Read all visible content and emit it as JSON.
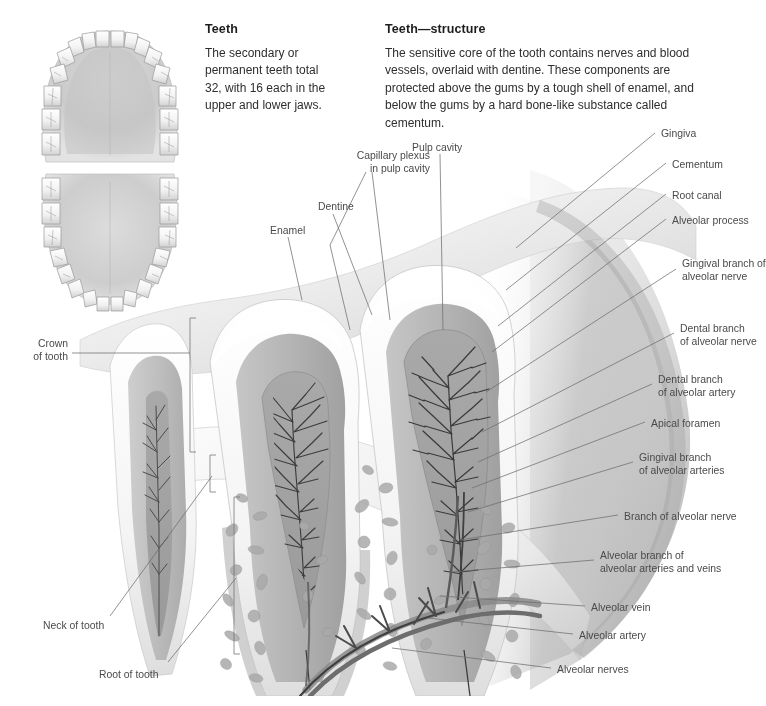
{
  "page": {
    "width": 766,
    "height": 706,
    "background": "#ffffff",
    "ink": "#4a4a4a",
    "heading_color": "#1d1d1d",
    "leader_color": "#6e6e6e"
  },
  "text_blocks": [
    {
      "id": "teeth",
      "heading": "Teeth",
      "body": "The secondary or permanent teeth total 32, with 16 each in the upper and lower jaws."
    },
    {
      "id": "structure",
      "heading": "Teeth—structure",
      "body": "The sensitive core of the tooth contains nerves and blood vessels, overlaid with dentine. These components are protected above the gums by a tough shell of enamel, and below the gums by a hard bone-like substance called cementum."
    }
  ],
  "arch_diagrams": [
    {
      "id": "upper-jaw-arch",
      "caption": "upper jaw dental arch",
      "teeth_count": 16
    },
    {
      "id": "lower-jaw-arch",
      "caption": "lower jaw dental arch",
      "teeth_count": 16
    }
  ],
  "labels_top": [
    {
      "id": "enamel",
      "text": "Enamel",
      "x": 270,
      "y": 225,
      "align": "left"
    },
    {
      "id": "dentine",
      "text": "Dentine",
      "x": 318,
      "y": 201,
      "align": "left"
    },
    {
      "id": "capillary-plexus",
      "text": "Capillary plexus\nin pulp cavity",
      "x": 335,
      "y": 150,
      "align": "left"
    },
    {
      "id": "pulp-cavity",
      "text": "Pulp cavity",
      "x": 412,
      "y": 142,
      "align": "left"
    }
  ],
  "labels_left": [
    {
      "id": "crown-of-tooth",
      "text": "Crown\nof tooth",
      "x": 20,
      "y": 338,
      "align": "left"
    },
    {
      "id": "neck-of-tooth",
      "text": "Neck of tooth",
      "x": 43,
      "y": 620,
      "align": "left"
    },
    {
      "id": "root-of-tooth",
      "text": "Root of tooth",
      "x": 99,
      "y": 669,
      "align": "left"
    }
  ],
  "labels_right": [
    {
      "id": "gingiva",
      "text": "Gingiva",
      "x": 661,
      "y": 128
    },
    {
      "id": "cementum",
      "text": "Cementum",
      "x": 672,
      "y": 159
    },
    {
      "id": "root-canal",
      "text": "Root canal",
      "x": 672,
      "y": 190
    },
    {
      "id": "alveolar-process",
      "text": "Alveolar process",
      "x": 672,
      "y": 215
    },
    {
      "id": "gingival-branch-nerve",
      "text": "Gingival branch of\nalveolar nerve",
      "x": 682,
      "y": 258
    },
    {
      "id": "dental-branch-nerve",
      "text": "Dental branch\nof alveolar nerve",
      "x": 680,
      "y": 323
    },
    {
      "id": "dental-branch-artery",
      "text": "Dental branch\nof alveolar artery",
      "x": 658,
      "y": 374
    },
    {
      "id": "apical-foramen",
      "text": "Apical foramen",
      "x": 651,
      "y": 418
    },
    {
      "id": "gingival-branch-arteries",
      "text": "Gingival branch\nof alveolar arteries",
      "x": 639,
      "y": 452
    },
    {
      "id": "branch-alveolar-nerve",
      "text": "Branch of alveolar nerve",
      "x": 624,
      "y": 511
    },
    {
      "id": "alveolar-branch-av",
      "text": "Alveolar branch of\nalveolar arteries and veins",
      "x": 600,
      "y": 550
    },
    {
      "id": "alveolar-vein",
      "text": "Alveolar vein",
      "x": 591,
      "y": 602
    },
    {
      "id": "alveolar-artery",
      "text": "Alveolar artery",
      "x": 579,
      "y": 630
    },
    {
      "id": "alveolar-nerves",
      "text": "Alveolar nerves",
      "x": 557,
      "y": 664
    }
  ]
}
